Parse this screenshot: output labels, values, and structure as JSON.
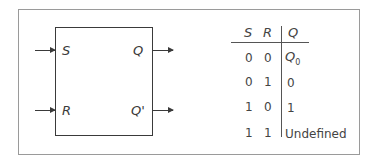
{
  "diagram": {
    "block": {
      "inputs": [
        {
          "label": "S"
        },
        {
          "label": "R"
        }
      ],
      "outputs": [
        {
          "label": "Q"
        },
        {
          "label": "Q'"
        }
      ]
    },
    "truth_table": {
      "headers": [
        "S",
        "R",
        "Q"
      ],
      "rows": [
        {
          "s": "0",
          "r": "0",
          "q": "Q",
          "q_sub": "0"
        },
        {
          "s": "0",
          "r": "1",
          "q": "0",
          "q_sub": ""
        },
        {
          "s": "1",
          "r": "0",
          "q": "1",
          "q_sub": ""
        },
        {
          "s": "1",
          "r": "1",
          "q": "Undefined",
          "q_sub": ""
        }
      ]
    }
  }
}
